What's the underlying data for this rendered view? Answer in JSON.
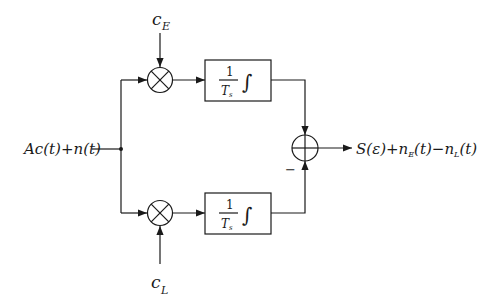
{
  "diagram": {
    "type": "block-diagram",
    "input": {
      "label": "Ac(t)+n(t)"
    },
    "references": {
      "early": {
        "base": "c",
        "sub": "E"
      },
      "late": {
        "base": "c",
        "sub": "L"
      }
    },
    "mixers": [
      {
        "id": "mixer-early",
        "symbol": "×"
      },
      {
        "id": "mixer-late",
        "symbol": "×"
      }
    ],
    "integrators": [
      {
        "id": "integrator-early",
        "numerator": "1",
        "denominator": "T",
        "denominator_sub": "s",
        "integral": "∫"
      },
      {
        "id": "integrator-late",
        "numerator": "1",
        "denominator": "T",
        "denominator_sub": "s",
        "integral": "∫"
      }
    ],
    "summer": {
      "symbol": "+",
      "minus_sign": "−"
    },
    "output": {
      "label": "S(ε)+n_E(t)−n_L(t)",
      "part1": "S(ε)+n",
      "sub1": "E",
      "part2": "(t)−n",
      "sub2": "L",
      "part3": "(t)"
    }
  }
}
